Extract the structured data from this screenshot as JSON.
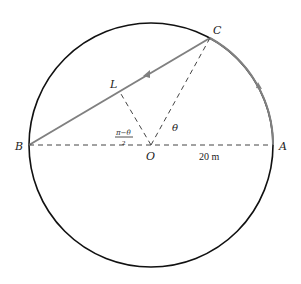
{
  "diagram": {
    "points": {
      "A": "A",
      "B": "B",
      "C": "C",
      "L": "L",
      "O": "O"
    },
    "angle_theta": "θ",
    "angle_half": {
      "numerator": "π−θ",
      "denominator": "2"
    },
    "radius_label": "20 m",
    "colors": {
      "circle": "#111111",
      "path": "#777777",
      "dashed": "#444444"
    }
  }
}
